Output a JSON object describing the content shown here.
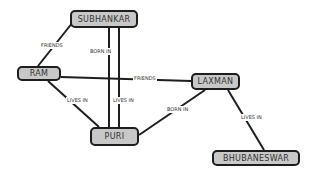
{
  "nodes": {
    "subhankar": {
      "label": "SUBHANKAR"
    },
    "ram": {
      "label": "RAM"
    },
    "laxman": {
      "label": "LAXMAN"
    },
    "puri": {
      "label": "PURI"
    },
    "bhubaneswar": {
      "label": "BHUBANESWAR"
    }
  },
  "edges": [
    {
      "from": "RAM",
      "to": "SUBHANKAR",
      "label": "FRIENDS"
    },
    {
      "from": "SUBHANKAR",
      "to": "PURI",
      "label": "BORN IN"
    },
    {
      "from": "RAM",
      "to": "LAXMAN",
      "label": "FRIENDS"
    },
    {
      "from": "RAM",
      "to": "PURI",
      "label": "LIVES IN"
    },
    {
      "from": "SUBHANKAR",
      "to": "PURI",
      "label": "LIVES IN"
    },
    {
      "from": "LAXMAN",
      "to": "PURI",
      "label": "BORN IN"
    },
    {
      "from": "LAXMAN",
      "to": "BHUBANESWAR",
      "label": "LIVES IN"
    }
  ],
  "colors": {
    "node_fill": "#c8c8c8",
    "stroke": "#1e1e1e"
  }
}
